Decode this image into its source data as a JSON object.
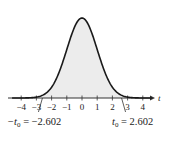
{
  "chart_data": {
    "type": "line",
    "title": "",
    "xlabel": "t",
    "ylabel": "",
    "xlim": [
      -4.5,
      4.5
    ],
    "x_ticks": [
      -4,
      -3,
      -2,
      -1,
      0,
      1,
      2,
      3,
      4
    ],
    "x_tick_labels": [
      "−4",
      "−3",
      "−2",
      "−1",
      "0",
      "1",
      "2",
      "3",
      "4"
    ],
    "shaded_region": {
      "from": -2.602,
      "to": 2.602
    },
    "critical_values": {
      "left": {
        "value": -2.602,
        "label": "−t₀ = −2.602"
      },
      "right": {
        "value": 2.602,
        "label": "t₀ = 2.602"
      }
    },
    "grid": false,
    "legend": null
  },
  "labels": {
    "axis_var": "t",
    "left_crit_prefix": "−t",
    "left_crit_sub": "0",
    "left_crit_value": " = −2.602",
    "right_crit_prefix": "t",
    "right_crit_sub": "0",
    "right_crit_value": " = 2.602"
  },
  "colors": {
    "curve": "#1a1a1a",
    "shade": "#ececec",
    "axis": "#333333"
  }
}
